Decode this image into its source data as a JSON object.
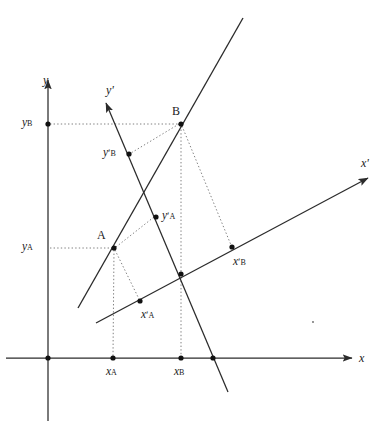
{
  "figure": {
    "type": "geometry-diagram",
    "background_color": "#ffffff",
    "line_color": "#2b2b2b",
    "dot_color": "#111111",
    "dotted_color": "#808080"
  },
  "axes": [
    {
      "id": "x-axis",
      "label": "x",
      "label_x": 359,
      "label_y": 352,
      "x1": 6,
      "y1": 358,
      "x2": 352,
      "y2": 358,
      "arrow": true
    },
    {
      "id": "y-axis",
      "label": "y",
      "label_x": 43,
      "label_y": 74,
      "x1": 48,
      "y1": 421,
      "x2": 48,
      "y2": 80,
      "arrow": true
    },
    {
      "id": "x-prime-axis",
      "label": "xʹ",
      "label_x": 361,
      "label_y": 157,
      "x1": 96,
      "y1": 323,
      "x2": 368,
      "y2": 178,
      "arrow": true
    },
    {
      "id": "y-prime-axis",
      "label": "yʹ",
      "label_x": 106,
      "label_y": 84,
      "x1": 228,
      "y1": 392,
      "x2": 106,
      "y2": 103,
      "arrow": true
    }
  ],
  "lines": [
    {
      "id": "line-through-A-B",
      "description": "straight line passing through points A and B",
      "x1": 78,
      "y1": 308,
      "x2": 243,
      "y2": 18
    }
  ],
  "points": [
    {
      "id": "origin",
      "label": "",
      "x": 48,
      "y": 358,
      "dot": true
    },
    {
      "id": "prime-origin",
      "label": "",
      "x": 181,
      "y": 274,
      "dot": true
    },
    {
      "id": "point-A",
      "label": "A",
      "x": 114,
      "y": 248,
      "dot": true,
      "label_x": 97,
      "label_y": 229
    },
    {
      "id": "point-B",
      "label": "B",
      "x": 181,
      "y": 124,
      "dot": true,
      "label_x": 172,
      "label_y": 105
    },
    {
      "id": "y-B-tick",
      "label": "y",
      "sub": "B",
      "prime": false,
      "x": 48,
      "y": 124,
      "dot": true,
      "label_x": 22,
      "label_y": 117
    },
    {
      "id": "y-A-tick",
      "label": "y",
      "sub": "A",
      "prime": false,
      "x": 48,
      "y": 248,
      "dot": false,
      "label_x": 22,
      "label_y": 241
    },
    {
      "id": "x-A-tick",
      "label": "x",
      "sub": "A",
      "prime": false,
      "x": 113,
      "y": 358,
      "dot": true,
      "label_x": 106,
      "label_y": 366
    },
    {
      "id": "x-B-tick",
      "label": "x",
      "sub": "B",
      "prime": false,
      "x": 181,
      "y": 358,
      "dot": true,
      "label_x": 174,
      "label_y": 366
    },
    {
      "id": "x-axis-crossing",
      "label": "",
      "x": 213,
      "y": 358,
      "dot": true
    },
    {
      "id": "y-prime-B-tick",
      "label": "y",
      "sub": "B",
      "prime": true,
      "x": 129,
      "y": 154,
      "dot": true,
      "label_x": 103,
      "label_y": 147
    },
    {
      "id": "y-prime-A-tick",
      "label": "y",
      "sub": "A",
      "prime": true,
      "x": 156,
      "y": 217,
      "dot": true,
      "label_x": 162,
      "label_y": 210
    },
    {
      "id": "x-prime-A-tick",
      "label": "x",
      "sub": "A",
      "prime": true,
      "x": 140,
      "y": 301,
      "dot": true,
      "label_x": 141,
      "label_y": 309
    },
    {
      "id": "x-prime-B-tick",
      "label": "x",
      "sub": "B",
      "prime": true,
      "x": 232,
      "y": 247,
      "dot": true,
      "label_x": 233,
      "label_y": 256
    },
    {
      "id": "stray-mark",
      "label": "",
      "x": 313,
      "y": 322,
      "dot": false
    }
  ],
  "projection_lines": [
    {
      "id": "proj-yB-to-B",
      "x1": 50,
      "y1": 124,
      "x2": 179,
      "y2": 124,
      "style": "dotted"
    },
    {
      "id": "proj-yA-to-A",
      "x1": 50,
      "y1": 248,
      "x2": 112,
      "y2": 248,
      "style": "dotted"
    },
    {
      "id": "proj-A-to-xA",
      "x1": 114,
      "y1": 250,
      "x2": 113,
      "y2": 356,
      "style": "dotted"
    },
    {
      "id": "proj-B-to-xB",
      "x1": 181,
      "y1": 126,
      "x2": 181,
      "y2": 356,
      "style": "dotted"
    },
    {
      "id": "proj-B-to-yprimeB",
      "x1": 179,
      "y1": 124,
      "x2": 131,
      "y2": 153,
      "style": "dotted"
    },
    {
      "id": "proj-A-to-yprimeA",
      "x1": 116,
      "y1": 247,
      "x2": 154,
      "y2": 217,
      "style": "dotted"
    },
    {
      "id": "proj-A-to-xprimeA",
      "x1": 115,
      "y1": 250,
      "x2": 139,
      "y2": 299,
      "style": "dotted"
    },
    {
      "id": "proj-B-to-xprimeB",
      "x1": 182,
      "y1": 126,
      "x2": 231,
      "y2": 245,
      "style": "dotted"
    }
  ],
  "labels": {
    "x_axis": "x",
    "y_axis": "y",
    "x_prime_axis": "xʹ",
    "y_prime_axis": "yʹ",
    "point_a": "A",
    "point_b": "B",
    "y_b": "y",
    "y_a": "y",
    "x_a": "x",
    "x_b": "x",
    "y_prime_b": "y",
    "y_prime_a": "y",
    "x_prime_a": "x",
    "x_prime_b": "x",
    "sub_a": "A",
    "sub_b": "B",
    "prime_mark": "ʹ"
  }
}
